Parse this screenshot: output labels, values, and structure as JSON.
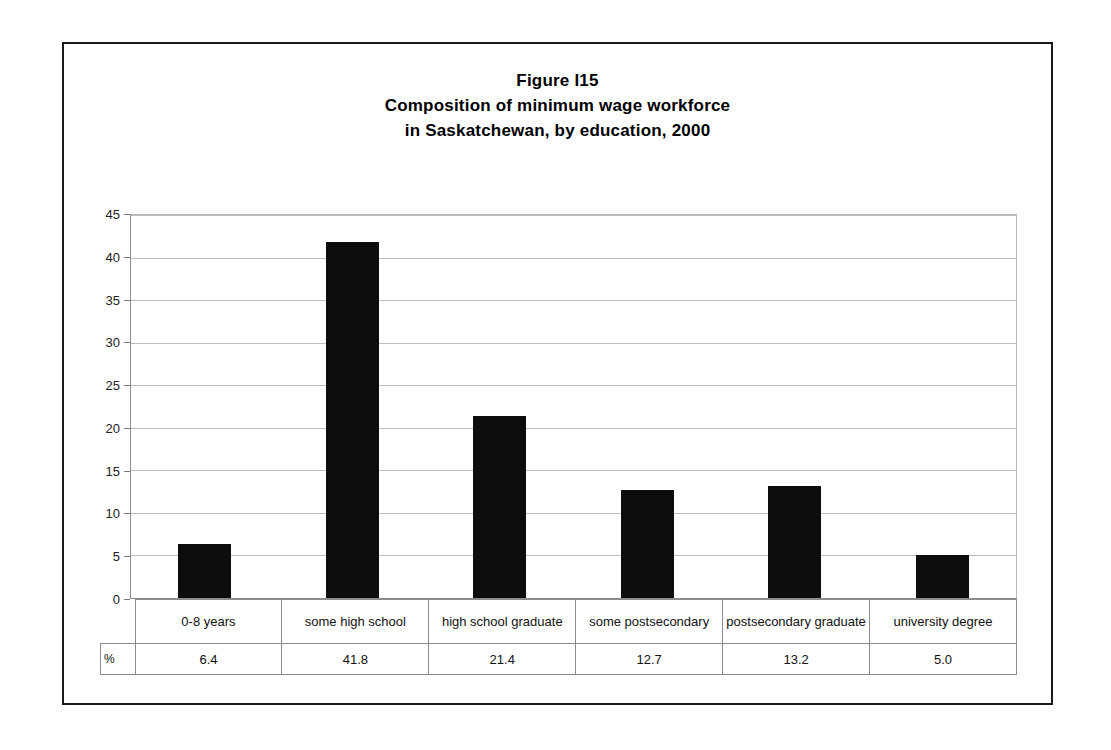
{
  "figure": {
    "title_lines": [
      "Figure I15",
      "Composition of minimum wage workforce",
      "in Saskatchewan, by education, 2000"
    ],
    "percent_symbol": "%"
  },
  "chart_data": {
    "type": "bar",
    "xlabel": "",
    "ylabel": "",
    "ylim": [
      0,
      45
    ],
    "ytick_step": 5,
    "yticks": [
      45,
      40,
      35,
      30,
      25,
      20,
      15,
      10,
      5,
      0
    ],
    "grid": true,
    "legend": false,
    "bar_color": "#0d0d0d",
    "gridline_color": "#bdbdbd",
    "units": "%",
    "categories": [
      "0-8 years",
      "some high school",
      "high school graduate",
      "some postsecondary",
      "postsecondary graduate",
      "university degree"
    ],
    "values": [
      6.4,
      41.8,
      21.4,
      12.7,
      13.2,
      5.0
    ],
    "value_labels": [
      "6.4",
      "41.8",
      "21.4",
      "12.7",
      "13.2",
      "5.0"
    ]
  }
}
